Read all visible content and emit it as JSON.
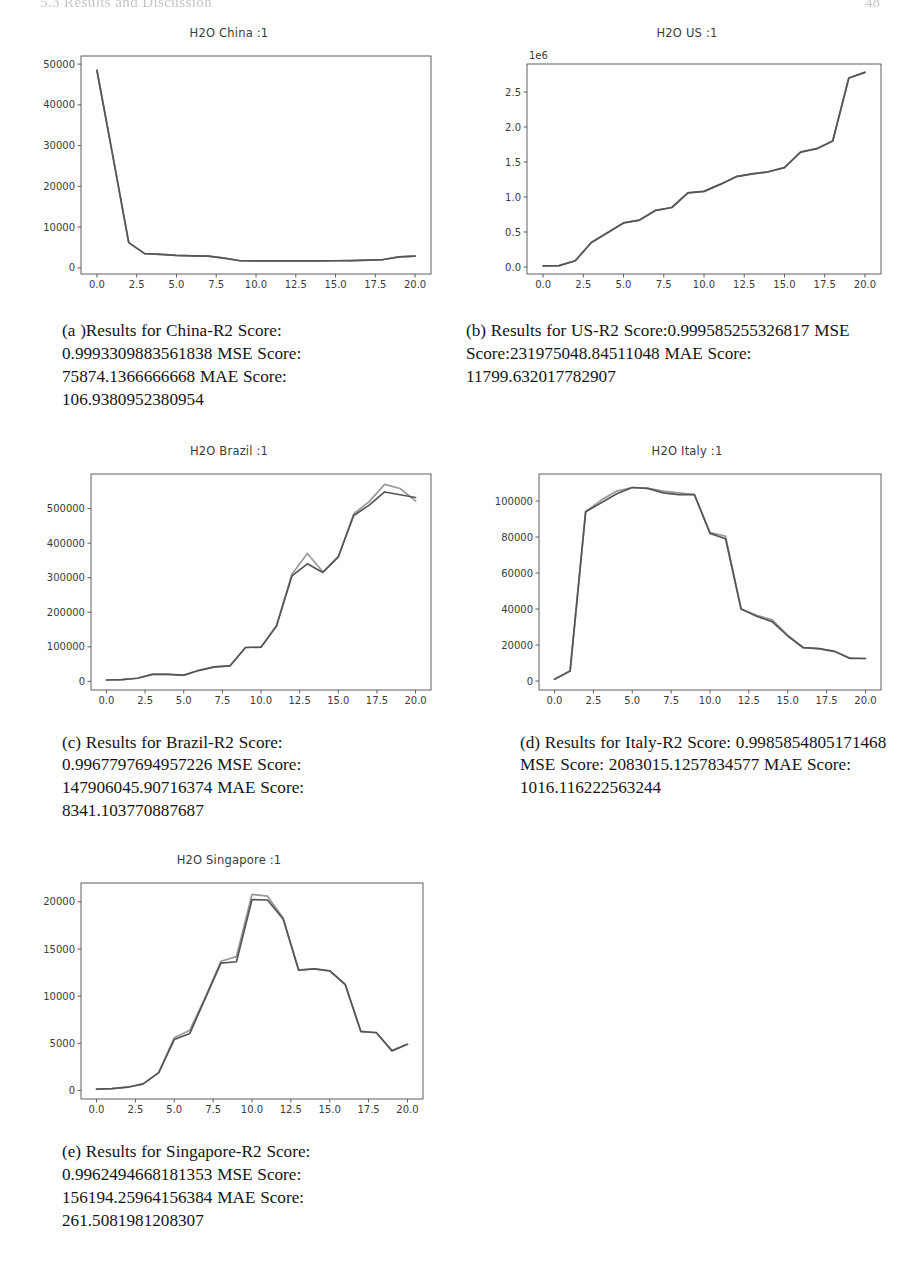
{
  "page": {
    "running_head": "5.3   Results and Discussion",
    "page_number": "48"
  },
  "figures": [
    {
      "id": "china",
      "title": "H2O China :1",
      "caption": "(a )Results for China-R2 Score: 0.9993309883561838 MSE Score: 75874.1366666668 MAE Score: 106.9380952380954"
    },
    {
      "id": "us",
      "title": "H2O US :1",
      "caption": "(b) Results for US-R2 Score:0.999585255326817 MSE Score:231975048.84511048 MAE Score: 11799.632017782907"
    },
    {
      "id": "brazil",
      "title": "H2O Brazil :1",
      "caption": "(c) Results for Brazil-R2 Score: 0.9967797694957226 MSE Score: 147906045.90716374 MAE Score: 8341.103770887687"
    },
    {
      "id": "italy",
      "title": "H2O Italy :1",
      "caption": "(d) Results for Italy-R2 Score: 0.9985854805171468 MSE Score: 2083015.1257834577 MAE Score: 1016.116222563244"
    },
    {
      "id": "singapore",
      "title": "H2O Singapore :1",
      "caption": "(e) Results for Singapore-R2 Score: 0.9962494668181353 MSE Score: 156194.25964156384 MAE Score: 261.5081981208307"
    }
  ],
  "chart_data": [
    {
      "type": "line",
      "title": "H2O China :1",
      "xlabel": "",
      "ylabel": "",
      "grid": false,
      "legend": "none",
      "xlim": [
        -1.0,
        21.0
      ],
      "ylim": [
        -1500,
        52000
      ],
      "xticks": [
        "0.0",
        "2.5",
        "5.0",
        "7.5",
        "10.0",
        "12.5",
        "15.0",
        "17.5",
        "20.0"
      ],
      "xtickvals": [
        0.0,
        2.5,
        5.0,
        7.5,
        10.0,
        12.5,
        15.0,
        17.5,
        20.0
      ],
      "yticks": [
        "0",
        "10000",
        "20000",
        "30000",
        "40000",
        "50000"
      ],
      "ytickvals": [
        0,
        10000,
        20000,
        30000,
        40000,
        50000
      ],
      "x": [
        0,
        1,
        2,
        3,
        4,
        5,
        6,
        7,
        8,
        9,
        10,
        11,
        12,
        13,
        14,
        15,
        16,
        17,
        18,
        19,
        20
      ],
      "series": [
        {
          "name": "actual",
          "color": "#555555",
          "values": [
            48500,
            27500,
            6200,
            3500,
            3300,
            3050,
            2950,
            2900,
            2400,
            1750,
            1700,
            1700,
            1700,
            1700,
            1700,
            1750,
            1800,
            1900,
            2050,
            2700,
            2900
          ]
        },
        {
          "name": "predicted",
          "color": "#8c8c8c",
          "values": [
            48500,
            27500,
            6200,
            3500,
            3300,
            3050,
            2950,
            2900,
            2400,
            1750,
            1700,
            1700,
            1700,
            1700,
            1700,
            1750,
            1800,
            1900,
            2050,
            2700,
            2900
          ]
        }
      ]
    },
    {
      "type": "line",
      "title": "H2O US :1",
      "xlabel": "",
      "ylabel": "",
      "offset_text": "1e6",
      "grid": false,
      "legend": "none",
      "xlim": [
        -1.0,
        21.0
      ],
      "ylim": [
        -100000,
        2900000
      ],
      "xticks": [
        "0.0",
        "2.5",
        "5.0",
        "7.5",
        "10.0",
        "12.5",
        "15.0",
        "17.5",
        "20.0"
      ],
      "xtickvals": [
        0.0,
        2.5,
        5.0,
        7.5,
        10.0,
        12.5,
        15.0,
        17.5,
        20.0
      ],
      "yticks": [
        "0.0",
        "0.5",
        "1.0",
        "1.5",
        "2.0",
        "2.5"
      ],
      "ytickvals": [
        0,
        500000,
        1000000,
        1500000,
        2000000,
        2500000
      ],
      "x": [
        0,
        1,
        2,
        3,
        4,
        5,
        6,
        7,
        8,
        9,
        10,
        11,
        12,
        13,
        14,
        15,
        16,
        17,
        18,
        19,
        20
      ],
      "series": [
        {
          "name": "actual",
          "color": "#555555",
          "values": [
            15000,
            20000,
            90000,
            350000,
            490000,
            630000,
            670000,
            810000,
            850000,
            1060000,
            1080000,
            1180000,
            1290000,
            1330000,
            1360000,
            1420000,
            1640000,
            1690000,
            1800000,
            2700000,
            2780000
          ]
        },
        {
          "name": "predicted",
          "color": "#8c8c8c",
          "values": [
            15000,
            20000,
            90000,
            350000,
            490000,
            630000,
            670000,
            810000,
            850000,
            1060000,
            1080000,
            1180000,
            1290000,
            1330000,
            1360000,
            1420000,
            1640000,
            1690000,
            1800000,
            2700000,
            2780000
          ]
        }
      ]
    },
    {
      "type": "line",
      "title": "H2O Brazil :1",
      "xlabel": "",
      "ylabel": "",
      "grid": false,
      "legend": "none",
      "xlim": [
        -1.0,
        21.0
      ],
      "ylim": [
        -25000,
        600000
      ],
      "xticks": [
        "0.0",
        "2.5",
        "5.0",
        "7.5",
        "10.0",
        "12.5",
        "15.0",
        "17.5",
        "20.0"
      ],
      "xtickvals": [
        0.0,
        2.5,
        5.0,
        7.5,
        10.0,
        12.5,
        15.0,
        17.5,
        20.0
      ],
      "yticks": [
        "0",
        "100000",
        "200000",
        "300000",
        "400000",
        "500000"
      ],
      "ytickvals": [
        0,
        100000,
        200000,
        300000,
        400000,
        500000
      ],
      "x": [
        0,
        1,
        2,
        3,
        4,
        5,
        6,
        7,
        8,
        9,
        10,
        11,
        12,
        13,
        14,
        15,
        16,
        17,
        18,
        19,
        20
      ],
      "series": [
        {
          "name": "actual",
          "color": "#555555",
          "values": [
            4000,
            5000,
            9000,
            20000,
            20000,
            18000,
            32000,
            42000,
            45000,
            98000,
            99000,
            160000,
            305000,
            340000,
            315000,
            360000,
            480000,
            510000,
            548000,
            540000,
            532000
          ]
        },
        {
          "name": "predicted",
          "color": "#9a9a9a",
          "values": [
            4000,
            5000,
            9000,
            21000,
            20000,
            17000,
            32000,
            42000,
            45000,
            98000,
            99000,
            160000,
            310000,
            370000,
            317000,
            360000,
            485000,
            520000,
            570000,
            558000,
            522000
          ]
        }
      ]
    },
    {
      "type": "line",
      "title": "H2O Italy :1",
      "xlabel": "",
      "ylabel": "",
      "grid": false,
      "legend": "none",
      "xlim": [
        -1.0,
        21.0
      ],
      "ylim": [
        -5000,
        115000
      ],
      "xticks": [
        "0.0",
        "2.5",
        "5.0",
        "7.5",
        "10.0",
        "12.5",
        "15.0",
        "17.5",
        "20.0"
      ],
      "xtickvals": [
        0.0,
        2.5,
        5.0,
        7.5,
        10.0,
        12.5,
        15.0,
        17.5,
        20.0
      ],
      "yticks": [
        "0",
        "20000",
        "40000",
        "60000",
        "80000",
        "100000"
      ],
      "ytickvals": [
        0,
        20000,
        40000,
        60000,
        80000,
        100000
      ],
      "x": [
        0,
        1,
        2,
        3,
        4,
        5,
        6,
        7,
        8,
        9,
        10,
        11,
        12,
        13,
        14,
        15,
        16,
        17,
        18,
        19,
        20
      ],
      "series": [
        {
          "name": "actual",
          "color": "#555555",
          "values": [
            1000,
            5500,
            94000,
            99000,
            104000,
            107500,
            107000,
            104500,
            103500,
            103500,
            82000,
            79000,
            40000,
            36000,
            33000,
            25000,
            18500,
            18000,
            16500,
            12500,
            12500
          ]
        },
        {
          "name": "predicted",
          "color": "#9a9a9a",
          "values": [
            1000,
            5500,
            94000,
            100500,
            105500,
            107500,
            107000,
            105500,
            104500,
            103500,
            82500,
            80500,
            40000,
            36500,
            34000,
            25500,
            18500,
            18000,
            16500,
            12800,
            12500
          ]
        }
      ]
    },
    {
      "type": "line",
      "title": "H2O Singapore :1",
      "xlabel": "",
      "ylabel": "",
      "grid": false,
      "legend": "none",
      "xlim": [
        -1.0,
        21.0
      ],
      "ylim": [
        -900,
        22000
      ],
      "xticks": [
        "0.0",
        "2.5",
        "5.0",
        "7.5",
        "10.0",
        "12.5",
        "15.0",
        "17.5",
        "20.0"
      ],
      "xtickvals": [
        0.0,
        2.5,
        5.0,
        7.5,
        10.0,
        12.5,
        15.0,
        17.5,
        20.0
      ],
      "yticks": [
        "0",
        "5000",
        "10000",
        "15000",
        "20000"
      ],
      "ytickvals": [
        0,
        5000,
        10000,
        15000,
        20000
      ],
      "x": [
        0,
        1,
        2,
        3,
        4,
        5,
        6,
        7,
        8,
        9,
        10,
        11,
        12,
        13,
        14,
        15,
        16,
        17,
        18,
        19,
        20
      ],
      "series": [
        {
          "name": "actual",
          "color": "#555555",
          "values": [
            150,
            200,
            350,
            700,
            1900,
            5400,
            6050,
            9800,
            13500,
            13650,
            20250,
            20200,
            18200,
            12750,
            12900,
            12700,
            11250,
            6250,
            6150,
            4200,
            4900
          ]
        },
        {
          "name": "predicted",
          "color": "#9a9a9a",
          "values": [
            150,
            200,
            350,
            700,
            1900,
            5600,
            6400,
            9900,
            13700,
            14200,
            20800,
            20600,
            18300,
            12800,
            12900,
            12650,
            11200,
            6300,
            6100,
            4250,
            4900
          ]
        }
      ]
    }
  ]
}
